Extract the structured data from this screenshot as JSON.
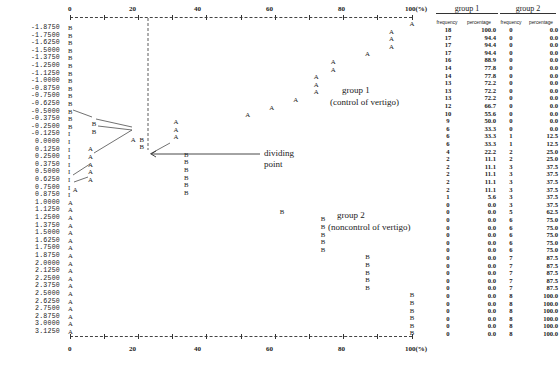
{
  "chart_data": {
    "type": "line",
    "title": "",
    "xlabel": "",
    "ylabel": "",
    "x_axis": {
      "ticks": [
        "0",
        "20",
        "40",
        "60",
        "80",
        "100(%)"
      ],
      "range": [
        0,
        100
      ],
      "unit": "%"
    },
    "rows": [
      {
        "cut": "-1.8750",
        "cls": "B",
        "g1f": 18,
        "g1p": "100.0",
        "g2f": 0,
        "g2p": "0.0"
      },
      {
        "cut": "-1.7500",
        "cls": "B",
        "g1f": 17,
        "g1p": "94.4",
        "g2f": 0,
        "g2p": "0.0"
      },
      {
        "cut": "-1.6250",
        "cls": "B",
        "g1f": 17,
        "g1p": "94.4",
        "g2f": 0,
        "g2p": "0.0"
      },
      {
        "cut": "-1.5000",
        "cls": "B",
        "g1f": 17,
        "g1p": "94.4",
        "g2f": 0,
        "g2p": "0.0"
      },
      {
        "cut": "-1.3750",
        "cls": "B",
        "g1f": 16,
        "g1p": "88.9",
        "g2f": 0,
        "g2p": "0.0"
      },
      {
        "cut": "-1.2500",
        "cls": "B",
        "g1f": 14,
        "g1p": "77.8",
        "g2f": 0,
        "g2p": "0.0"
      },
      {
        "cut": "-1.1250",
        "cls": "B",
        "g1f": 14,
        "g1p": "77.8",
        "g2f": 0,
        "g2p": "0.0"
      },
      {
        "cut": "-1.0000",
        "cls": "B",
        "g1f": 13,
        "g1p": "72.2",
        "g2f": 0,
        "g2p": "0.0"
      },
      {
        "cut": "-0.8750",
        "cls": "B",
        "g1f": 13,
        "g1p": "72.2",
        "g2f": 0,
        "g2p": "0.0"
      },
      {
        "cut": "-0.7500",
        "cls": "B",
        "g1f": 13,
        "g1p": "72.2",
        "g2f": 0,
        "g2p": "0.0"
      },
      {
        "cut": "-0.6250",
        "cls": "B",
        "g1f": 12,
        "g1p": "66.7",
        "g2f": 0,
        "g2p": "0.0"
      },
      {
        "cut": "-0.5000",
        "cls": "B",
        "g1f": 10,
        "g1p": "55.6",
        "g2f": 0,
        "g2p": "0.0"
      },
      {
        "cut": "-0.3750",
        "cls": "B",
        "g1f": 9,
        "g1p": "50.0",
        "g2f": 0,
        "g2p": "0.0"
      },
      {
        "cut": "-0.2500",
        "cls": "B",
        "g1f": 6,
        "g1p": "33.3",
        "g2f": 0,
        "g2p": "0.0"
      },
      {
        "cut": "-0.1250",
        "cls": "I",
        "g1f": 6,
        "g1p": "33.3",
        "g2f": 1,
        "g2p": "12.5"
      },
      {
        "cut": "0.0000",
        "cls": "I",
        "g1f": 6,
        "g1p": "33.3",
        "g2f": 1,
        "g2p": "12.5"
      },
      {
        "cut": "0.1250",
        "cls": "I",
        "g1f": 4,
        "g1p": "22.2",
        "g2f": 2,
        "g2p": "25.0"
      },
      {
        "cut": "0.2500",
        "cls": "I",
        "g1f": 2,
        "g1p": "11.1",
        "g2f": 2,
        "g2p": "25.0"
      },
      {
        "cut": "0.3750",
        "cls": "I",
        "g1f": 2,
        "g1p": "11.1",
        "g2f": 3,
        "g2p": "37.5"
      },
      {
        "cut": "0.5000",
        "cls": "I",
        "g1f": 2,
        "g1p": "11.1",
        "g2f": 3,
        "g2p": "37.5"
      },
      {
        "cut": "0.6250",
        "cls": "I",
        "g1f": 2,
        "g1p": "11.1",
        "g2f": 3,
        "g2p": "37.5"
      },
      {
        "cut": "0.7500",
        "cls": "I",
        "g1f": 2,
        "g1p": "11.1",
        "g2f": 3,
        "g2p": "37.5"
      },
      {
        "cut": "0.8750",
        "cls": "I",
        "g1f": 1,
        "g1p": "5.6",
        "g2f": 3,
        "g2p": "37.5"
      },
      {
        "cut": "1.0000",
        "cls": "A",
        "g1f": 0,
        "g1p": "0.0",
        "g2f": 3,
        "g2p": "37.5"
      },
      {
        "cut": "1.1250",
        "cls": "A",
        "g1f": 0,
        "g1p": "0.0",
        "g2f": 5,
        "g2p": "62.5"
      },
      {
        "cut": "1.2500",
        "cls": "A",
        "g1f": 0,
        "g1p": "0.0",
        "g2f": 6,
        "g2p": "75.0"
      },
      {
        "cut": "1.3750",
        "cls": "A",
        "g1f": 0,
        "g1p": "0.0",
        "g2f": 6,
        "g2p": "75.0"
      },
      {
        "cut": "1.5000",
        "cls": "A",
        "g1f": 0,
        "g1p": "0.0",
        "g2f": 6,
        "g2p": "75.0"
      },
      {
        "cut": "1.6250",
        "cls": "A",
        "g1f": 0,
        "g1p": "0.0",
        "g2f": 6,
        "g2p": "75.0"
      },
      {
        "cut": "1.7500",
        "cls": "A",
        "g1f": 0,
        "g1p": "0.0",
        "g2f": 6,
        "g2p": "75.0"
      },
      {
        "cut": "1.8750",
        "cls": "A",
        "g1f": 0,
        "g1p": "0.0",
        "g2f": 7,
        "g2p": "87.5"
      },
      {
        "cut": "2.0000",
        "cls": "A",
        "g1f": 0,
        "g1p": "0.0",
        "g2f": 7,
        "g2p": "87.5"
      },
      {
        "cut": "2.1250",
        "cls": "A",
        "g1f": 0,
        "g1p": "0.0",
        "g2f": 7,
        "g2p": "87.5"
      },
      {
        "cut": "2.2500",
        "cls": "A",
        "g1f": 0,
        "g1p": "0.0",
        "g2f": 7,
        "g2p": "87.5"
      },
      {
        "cut": "2.3750",
        "cls": "A",
        "g1f": 0,
        "g1p": "0.0",
        "g2f": 7,
        "g2p": "87.5"
      },
      {
        "cut": "2.5000",
        "cls": "A",
        "g1f": 0,
        "g1p": "0.0",
        "g2f": 8,
        "g2p": "100.0"
      },
      {
        "cut": "2.6250",
        "cls": "A",
        "g1f": 0,
        "g1p": "0.0",
        "g2f": 8,
        "g2p": "100.0"
      },
      {
        "cut": "2.7500",
        "cls": "A",
        "g1f": 0,
        "g1p": "0.0",
        "g2f": 8,
        "g2p": "100.0"
      },
      {
        "cut": "2.8750",
        "cls": "A",
        "g1f": 0,
        "g1p": "0.0",
        "g2f": 8,
        "g2p": "100.0"
      },
      {
        "cut": "3.0000",
        "cls": "A",
        "g1f": 0,
        "g1p": "0.0",
        "g2f": 8,
        "g2p": "100.0"
      },
      {
        "cut": "3.1250",
        "cls": "A",
        "g1f": 0,
        "g1p": "0.0",
        "g2f": 8,
        "g2p": "100.0"
      }
    ],
    "series": [
      {
        "name": "group 1 (control of vertigo)",
        "marker": "A"
      },
      {
        "name": "group 2 (noncontrol of vertigo)",
        "marker": "B"
      }
    ],
    "annotations": {
      "group1_label": "group 1",
      "group1_sub": "(control of vertigo)",
      "group2_label": "group 2",
      "group2_sub": "(noncontrol of vertigo)",
      "dividing_line1": "dividing",
      "dividing_line2": "point",
      "dividing_x_pct": 23
    },
    "table": {
      "group1_title": "group 1",
      "group2_title": "group 2",
      "col_freq": "frequency",
      "col_pct": "percentage"
    }
  }
}
